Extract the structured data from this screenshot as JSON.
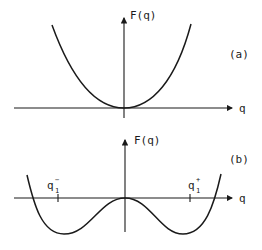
{
  "panels": [
    {
      "id": "a",
      "panel_label": "(a)",
      "y_axis_label": "F(q)",
      "x_axis_label": "q",
      "curve": "single-well parabola with minimum at q = 0"
    },
    {
      "id": "b",
      "panel_label": "(b)",
      "y_axis_label": "F(q)",
      "x_axis_label": "q",
      "curve": "double-well with local maximum at q = 0 and minima near q1- and q1+",
      "ticks": [
        {
          "base": "q",
          "sub": "1",
          "sup": "−"
        },
        {
          "base": "q",
          "sub": "1",
          "sup": "+"
        }
      ]
    }
  ]
}
